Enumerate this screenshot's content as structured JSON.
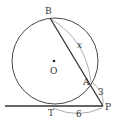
{
  "diagram": {
    "type": "geometry",
    "colors": {
      "stroke": "#333333",
      "arc": "#999999",
      "background": "#ffffff"
    },
    "points": {
      "B": {
        "label": "B"
      },
      "O": {
        "label": "O"
      },
      "A": {
        "label": "A"
      },
      "T": {
        "label": "T"
      },
      "P": {
        "label": "P"
      }
    },
    "measures": {
      "AB": {
        "label": "x"
      },
      "PA": {
        "label": "3"
      },
      "PT": {
        "label": "6"
      }
    }
  }
}
